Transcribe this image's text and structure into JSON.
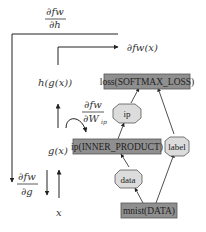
{
  "colors": {
    "layer_fill": "#8f8f8f",
    "layer_stroke": "#555555",
    "blob_fill": "#dcdcdc",
    "blob_stroke": "#555555",
    "line": "#222222"
  },
  "annotations": {
    "top_grad_num": "∂fw",
    "top_grad_den": "∂h",
    "output": "∂fw(x)",
    "hgx": "h(g(x))",
    "weight_grad_num": "∂fw",
    "weight_grad_den": "∂W",
    "weight_grad_sub": "ip",
    "gx": "g(x)",
    "g_grad_num": "∂fw",
    "g_grad_den": "∂g",
    "x": "x"
  },
  "nodes": {
    "loss": "loss(SOFTMAX_LOSS)",
    "ip_layer": "ip(INNER_PRODUCT)",
    "mnist": "mnist(DATA)",
    "ip_blob": "ip",
    "label_blob": "label",
    "data_blob": "data"
  }
}
